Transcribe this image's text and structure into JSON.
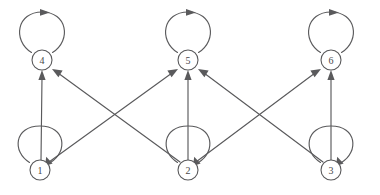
{
  "figure": {
    "background_color": "#ffffff",
    "stroke_color": "#5a5a5c",
    "label_color": "#48484a",
    "width": 380,
    "height": 195
  },
  "graph_data": {
    "type": "directed-graph",
    "node_count": 6,
    "edge_count": 13,
    "nodes": [
      {
        "id": "1",
        "label": "1",
        "x": 40,
        "y": 170,
        "row": "bottom",
        "radius": 10
      },
      {
        "id": "2",
        "label": "2",
        "x": 188,
        "y": 170,
        "row": "bottom",
        "radius": 10
      },
      {
        "id": "3",
        "label": "3",
        "x": 331,
        "y": 170,
        "row": "bottom",
        "radius": 10
      },
      {
        "id": "4",
        "label": "4",
        "x": 42,
        "y": 60,
        "row": "top",
        "radius": 10
      },
      {
        "id": "5",
        "label": "5",
        "x": 188,
        "y": 60,
        "row": "top",
        "radius": 10
      },
      {
        "id": "6",
        "label": "6",
        "x": 331,
        "y": 60,
        "row": "top",
        "radius": 10
      }
    ],
    "edges": [
      {
        "from": "1",
        "to": "1",
        "kind": "self-loop"
      },
      {
        "from": "2",
        "to": "2",
        "kind": "self-loop"
      },
      {
        "from": "3",
        "to": "3",
        "kind": "self-loop"
      },
      {
        "from": "4",
        "to": "4",
        "kind": "self-loop"
      },
      {
        "from": "5",
        "to": "5",
        "kind": "self-loop"
      },
      {
        "from": "6",
        "to": "6",
        "kind": "self-loop"
      },
      {
        "from": "1",
        "to": "4",
        "kind": "vertical"
      },
      {
        "from": "2",
        "to": "5",
        "kind": "vertical"
      },
      {
        "from": "3",
        "to": "6",
        "kind": "vertical"
      },
      {
        "from": "1",
        "to": "5",
        "kind": "diagonal"
      },
      {
        "from": "2",
        "to": "4",
        "kind": "diagonal"
      },
      {
        "from": "2",
        "to": "6",
        "kind": "diagonal"
      },
      {
        "from": "3",
        "to": "5",
        "kind": "diagonal"
      }
    ]
  }
}
